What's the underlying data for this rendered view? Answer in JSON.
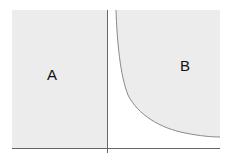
{
  "diagram": {
    "type": "region-diagram",
    "regions": [
      {
        "id": "A",
        "label": "A",
        "fill": "#ececec",
        "description": "rectangular shaded region left of vertical axis"
      },
      {
        "id": "B",
        "label": "B",
        "fill": "#ececec",
        "description": "shaded region above/right of hyperbolic curve"
      }
    ],
    "axes": {
      "color": "#666666",
      "vertical": {
        "x": 107
      },
      "horizontal": {
        "y": 148
      }
    },
    "curve": {
      "color": "#8a8a8a",
      "shape": "hyperbola"
    }
  }
}
